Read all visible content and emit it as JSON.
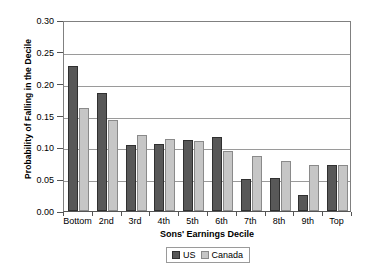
{
  "chart_data": {
    "type": "bar",
    "title": "",
    "xlabel": "Sons' Earnings Decile",
    "ylabel": "Probability of Falling in the Decile",
    "categories": [
      "Bottom",
      "2nd",
      "3rd",
      "4th",
      "5th",
      "6th",
      "7th",
      "8th",
      "9th",
      "Top"
    ],
    "series": [
      {
        "name": "US",
        "color": "#585858",
        "values": [
          0.228,
          0.186,
          0.104,
          0.105,
          0.112,
          0.116,
          0.051,
          0.052,
          0.025,
          0.073
        ]
      },
      {
        "name": "Canada",
        "color": "#c6c6c6",
        "values": [
          0.162,
          0.143,
          0.12,
          0.113,
          0.11,
          0.094,
          0.087,
          0.078,
          0.072,
          0.073
        ]
      }
    ],
    "ylim": [
      0.0,
      0.3
    ],
    "ytick_values": [
      0.3,
      0.25,
      0.2,
      0.15,
      0.1,
      0.05,
      0.0
    ],
    "ytick_labels": [
      "0.30",
      "0.25",
      "0.20",
      "0.15",
      "0.10",
      "0.05",
      "0.00"
    ],
    "grid": true,
    "legend_position": "bottom-center",
    "legend_entries": [
      "US",
      "Canada"
    ]
  }
}
